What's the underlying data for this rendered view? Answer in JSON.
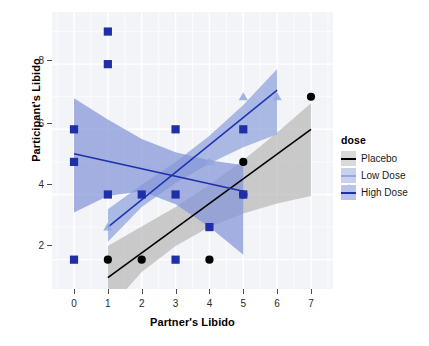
{
  "chart_data": {
    "type": "scatter",
    "title": "",
    "xlabel": "Partner's Libido",
    "ylabel": "Participant's Libido",
    "xlim": [
      -0.65,
      7.65
    ],
    "ylim": [
      1.1,
      9.6
    ],
    "xticks": [
      0,
      1,
      2,
      3,
      4,
      5,
      6,
      7
    ],
    "yticks": [
      2,
      4,
      6,
      8
    ],
    "xtick_labels": [
      "0",
      "1",
      "2",
      "3",
      "4",
      "5",
      "6",
      "7"
    ],
    "ytick_labels": [
      "2",
      "4",
      "6",
      "8"
    ],
    "grid": true,
    "legend_position": "right",
    "legend_title": "dose",
    "series": [
      {
        "name": "Placebo",
        "color": "#000000",
        "ribbon_color": "#b8b8b8",
        "marker": "circle",
        "points": [
          {
            "x": 1,
            "y": 2
          },
          {
            "x": 2,
            "y": 2
          },
          {
            "x": 4,
            "y": 2
          },
          {
            "x": 5,
            "y": 4
          },
          {
            "x": 5,
            "y": 5
          },
          {
            "x": 7,
            "y": 7
          }
        ],
        "fit_line": {
          "x1": 1.0,
          "y1": 1.45,
          "x2": 7.0,
          "y2": 6.0
        },
        "ribbon": {
          "x": [
            1.0,
            2.0,
            3.0,
            4.0,
            5.0,
            6.0,
            7.0
          ],
          "lower": [
            0.45,
            1.62,
            2.42,
            3.0,
            3.42,
            3.72,
            3.95
          ],
          "upper": [
            2.42,
            3.02,
            3.62,
            4.3,
            5.05,
            5.9,
            6.8
          ]
        }
      },
      {
        "name": "Low Dose",
        "color": "#2233b5",
        "ribbon_color": "#8ea2dd",
        "marker": "triangle",
        "points": [
          {
            "x": 1,
            "y": 3
          },
          {
            "x": 4,
            "y": 5
          },
          {
            "x": 5,
            "y": 7
          },
          {
            "x": 6,
            "y": 7
          }
        ],
        "fit_line": {
          "x1": 1.0,
          "y1": 3.0,
          "x2": 6.0,
          "y2": 7.2
        },
        "ribbon": {
          "x": [
            1.0,
            2.0,
            3.0,
            4.0,
            5.0,
            6.0
          ],
          "lower": [
            2.55,
            3.62,
            4.35,
            4.95,
            5.45,
            5.85
          ],
          "upper": [
            3.55,
            4.3,
            5.0,
            5.8,
            6.75,
            7.85
          ]
        }
      },
      {
        "name": "High Dose",
        "color": "#1f2fa8",
        "ribbon_color": "#8494d8",
        "marker": "square",
        "points": [
          {
            "x": 0,
            "y": 2
          },
          {
            "x": 0,
            "y": 5
          },
          {
            "x": 0,
            "y": 6
          },
          {
            "x": 1,
            "y": 4
          },
          {
            "x": 1,
            "y": 8
          },
          {
            "x": 1,
            "y": 9
          },
          {
            "x": 2,
            "y": 4
          },
          {
            "x": 3,
            "y": 2
          },
          {
            "x": 3,
            "y": 4
          },
          {
            "x": 3,
            "y": 6
          },
          {
            "x": 4,
            "y": 3
          },
          {
            "x": 5,
            "y": 4
          },
          {
            "x": 5,
            "y": 6
          }
        ],
        "fit_line": {
          "x1": 0.0,
          "y1": 5.25,
          "x2": 5.0,
          "y2": 4.1
        },
        "ribbon": {
          "x": [
            0.0,
            1.0,
            2.0,
            3.0,
            4.0,
            5.0
          ],
          "lower": [
            3.45,
            3.95,
            4.1,
            3.7,
            3.0,
            2.15
          ],
          "upper": [
            6.95,
            6.3,
            5.7,
            5.3,
            5.05,
            4.9
          ]
        }
      }
    ]
  },
  "legend": {
    "title": "dose",
    "items": [
      {
        "label": "Placebo",
        "marker": "circle-icon",
        "color": "#000000",
        "key_bg": "#d9d9d9"
      },
      {
        "label": "Low Dose",
        "marker": "triangle-icon",
        "color": "#93a7e0",
        "key_bg": "#c7d1ee"
      },
      {
        "label": "High Dose",
        "marker": "square-icon",
        "color": "#1f2fa8",
        "key_bg": "#b9c3ec"
      }
    ]
  }
}
